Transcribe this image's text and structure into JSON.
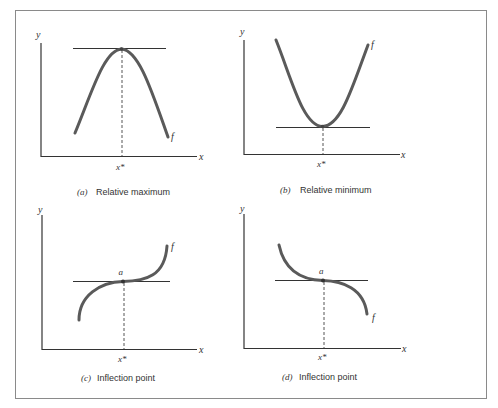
{
  "figure": {
    "colors": {
      "curve": "#5a5a5a",
      "axis": "#333333",
      "tangent": "#333333",
      "dashed": "#555555",
      "frame": "#8a8a8a",
      "text": "#333333"
    },
    "panels": [
      {
        "id": "a",
        "caption_letter": "(a)",
        "caption_text": "Relative maximum",
        "y_label": "y",
        "x_label": "x",
        "x_star_label": "x*",
        "function_label": "f",
        "point_label": "",
        "type": "relative-maximum"
      },
      {
        "id": "b",
        "caption_letter": "(b)",
        "caption_text": "Relative minimum",
        "y_label": "y",
        "x_label": "x",
        "x_star_label": "x*",
        "function_label": "f",
        "point_label": "",
        "type": "relative-minimum"
      },
      {
        "id": "c",
        "caption_letter": "(c)",
        "caption_text": "Inflection point",
        "y_label": "y",
        "x_label": "x",
        "x_star_label": "x*",
        "function_label": "f",
        "point_label": "a",
        "type": "inflection-increasing"
      },
      {
        "id": "d",
        "caption_letter": "(d)",
        "caption_text": "Inflection point",
        "y_label": "y",
        "x_label": "x",
        "x_star_label": "x*",
        "function_label": "f",
        "point_label": "a",
        "type": "inflection-decreasing"
      }
    ]
  }
}
